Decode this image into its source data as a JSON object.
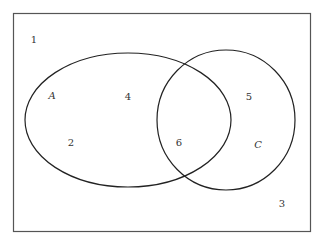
{
  "diagram": {
    "type": "venn",
    "universe": {
      "x": 13,
      "y": 13,
      "width": 297,
      "height": 218,
      "stroke": "#555555"
    },
    "sets": [
      {
        "name": "A",
        "cx": 128,
        "cy": 120,
        "rx": 103,
        "ry": 67,
        "label_pos": [
          52,
          96
        ]
      },
      {
        "name": "C",
        "cx": 226,
        "cy": 120,
        "rx": 69,
        "ry": 70,
        "label_pos": [
          258,
          145
        ]
      }
    ],
    "regions": [
      {
        "label": "1",
        "pos": [
          34,
          40
        ]
      },
      {
        "label": "4",
        "pos": [
          128,
          97
        ]
      },
      {
        "label": "5",
        "pos": [
          249,
          97
        ]
      },
      {
        "label": "2",
        "pos": [
          71,
          143
        ]
      },
      {
        "label": "6",
        "pos": [
          179,
          143
        ]
      },
      {
        "label": "3",
        "pos": [
          282,
          204
        ]
      }
    ]
  }
}
